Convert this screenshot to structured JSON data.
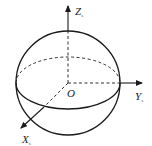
{
  "diagram": {
    "title": "",
    "type": "sphere-coordinate-system",
    "origin_label": "O",
    "axes": [
      {
        "name": "Z",
        "subscript": "s"
      },
      {
        "name": "Y",
        "subscript": "s"
      },
      {
        "name": "X",
        "subscript": "s"
      }
    ],
    "colors": {
      "stroke": "#1a1a1a",
      "background": "#ffffff"
    }
  }
}
